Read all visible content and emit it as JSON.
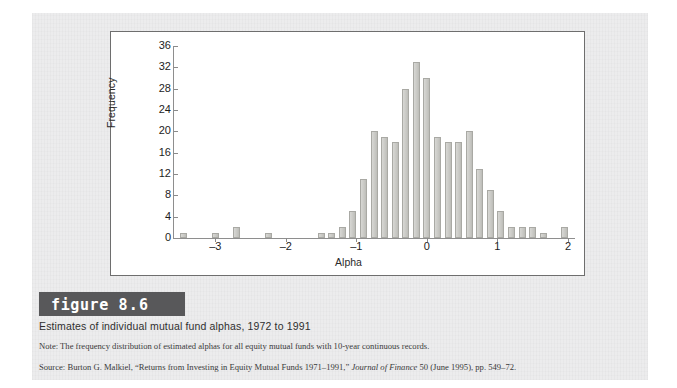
{
  "figure": {
    "banner_word": "figure",
    "banner_number": "8.6",
    "title": "Estimates of individual mutual fund alphas, 1972 to 1991",
    "note": "Note: The frequency distribution of estimated alphas for all equity mutual funds with 10-year continuous records.",
    "source_prefix": "Source: Burton G. Malkiel, “Returns from Investing in Equity Mutual Funds 1971–1991,” ",
    "source_italic": "Journal of Finance",
    "source_suffix": " 50 (June 1995), pp. 549–72."
  },
  "colors": {
    "page_background": "#ececed",
    "panel_background": "#ffffff",
    "panel_border": "#6e6e6e",
    "bar_fill": "#cfcfcb",
    "bar_border": "#a9a9a4",
    "axis": "#8e8e8e",
    "banner": "#58585a",
    "text": "#1d1d1d"
  },
  "chart_data": {
    "type": "bar",
    "title": "",
    "xlabel": "Alpha",
    "ylabel": "Frequency",
    "xlim": [
      -3.6,
      2.1
    ],
    "ylim": [
      0,
      36
    ],
    "grid": false,
    "legend": null,
    "bin_width": 0.15,
    "y_ticks": [
      0,
      4,
      8,
      12,
      16,
      20,
      24,
      28,
      32,
      36
    ],
    "y_tick_labels": [
      "0",
      "4",
      "8",
      "12",
      "16",
      "20",
      "24",
      "28",
      "32",
      "36"
    ],
    "x_ticks": [
      -3,
      -2,
      -1,
      0,
      1,
      2
    ],
    "x_tick_labels": [
      "–3",
      "–2",
      "–1",
      "0",
      "1",
      "2"
    ],
    "categories": [
      -3.45,
      -3.0,
      -2.7,
      -2.25,
      -1.8,
      -1.5,
      -1.35,
      -1.2,
      -1.05,
      -0.9,
      -0.75,
      -0.6,
      -0.45,
      -0.3,
      -0.15,
      0.0,
      0.15,
      0.3,
      0.45,
      0.6,
      0.75,
      0.9,
      1.05,
      1.2,
      1.35,
      1.5,
      1.65,
      1.8,
      1.95
    ],
    "values": [
      1,
      1,
      2,
      1,
      0,
      1,
      1,
      2,
      5,
      11,
      20,
      19,
      18,
      28,
      33,
      30,
      19,
      18,
      18,
      20,
      13,
      9,
      5,
      2,
      2,
      2,
      1,
      0,
      2
    ]
  }
}
